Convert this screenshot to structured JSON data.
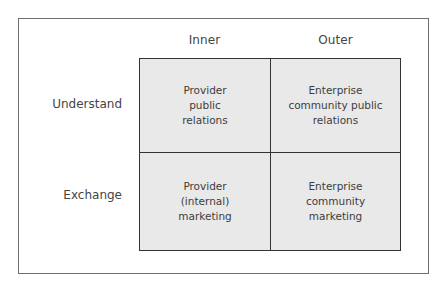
{
  "diagram": {
    "columns": [
      {
        "label": "Inner"
      },
      {
        "label": "Outer"
      }
    ],
    "rows": [
      {
        "label": "Understand"
      },
      {
        "label": "Exchange"
      }
    ],
    "cells": [
      [
        "Provider\npublic\nrelations",
        "Enterprise\ncommunity public\nrelations"
      ],
      [
        "Provider\n(internal)\nmarketing",
        "Enterprise\ncommunity\nmarketing"
      ]
    ],
    "colors": {
      "cell_fill": "#e9e9e9",
      "grid_line": "#333333",
      "frame_border": "#6e6e6e",
      "text": "#444444"
    }
  }
}
